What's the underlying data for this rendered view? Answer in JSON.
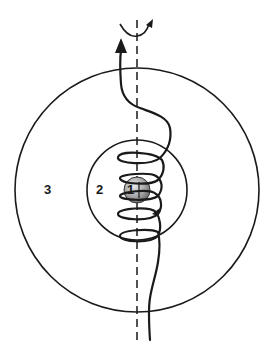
{
  "diagram": {
    "regions": [
      {
        "id": "1",
        "label": "1",
        "description": "central sphere (nucleus)"
      },
      {
        "id": "2",
        "label": "2",
        "description": "inner circle region"
      },
      {
        "id": "3",
        "label": "3",
        "description": "outer circle region"
      }
    ],
    "axis": {
      "style": "dashed",
      "rotation_arrow": true
    },
    "trajectory": {
      "style": "helical path with arrowhead",
      "direction": "upward"
    },
    "colors": {
      "stroke": "#1a1a1a",
      "sphere_light": "#e0e0e0",
      "sphere_dark": "#7a7a7a",
      "background": "#ffffff"
    }
  }
}
